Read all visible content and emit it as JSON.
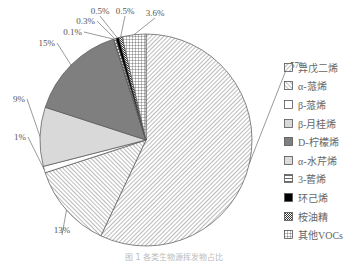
{
  "chart_data": {
    "type": "pie",
    "title": "",
    "caption": "图 1 各类生物源挥发物占比",
    "start": "top, clockwise",
    "slices": [
      {
        "name": "异戊二烯",
        "value": 57,
        "label": "57%",
        "pattern": "diag-right",
        "color": "#ffffff"
      },
      {
        "name": "α-蒎烯",
        "value": 13,
        "label": "13%",
        "pattern": "diag-left",
        "color": "#ffffff"
      },
      {
        "name": "β-蒎烯",
        "value": 1,
        "label": "1%",
        "pattern": "none",
        "color": "#ffffff"
      },
      {
        "name": "β-月桂烯",
        "value": 9,
        "label": "9%",
        "pattern": "solid",
        "color": "#d9d9d9"
      },
      {
        "name": "D-柠檬烯",
        "value": 15,
        "label": "15%",
        "pattern": "solid",
        "color": "#7f7f7f"
      },
      {
        "name": "α-水芹烯",
        "value": 0.1,
        "label": "0.1%",
        "pattern": "dots",
        "color": "#ffffff"
      },
      {
        "name": "3-蒈烯",
        "value": 0.3,
        "label": "0.3%",
        "pattern": "hlines",
        "color": "#ffffff"
      },
      {
        "name": "环己烯",
        "value": 0.5,
        "label": "0.5%",
        "pattern": "solid",
        "color": "#000000"
      },
      {
        "name": "桉油精",
        "value": 0.5,
        "label": "0.5%",
        "pattern": "checker",
        "color": "#ffffff"
      },
      {
        "name": "其他VOCs",
        "value": 3.6,
        "label": "3.6%",
        "pattern": "grid",
        "color": "#ffffff"
      }
    ],
    "legend_position": "right"
  },
  "legend": {
    "items": [
      {
        "label": "异戊二烯"
      },
      {
        "label": "α-蒎烯"
      },
      {
        "label": "β-蒎烯"
      },
      {
        "label": "β-月桂烯"
      },
      {
        "label": "D-柠檬烯"
      },
      {
        "label": "α-水芹烯"
      },
      {
        "label": "3-蒈烯"
      },
      {
        "label": "环己烯"
      },
      {
        "label": "桉油精"
      },
      {
        "label": "其他VOCs"
      }
    ]
  }
}
